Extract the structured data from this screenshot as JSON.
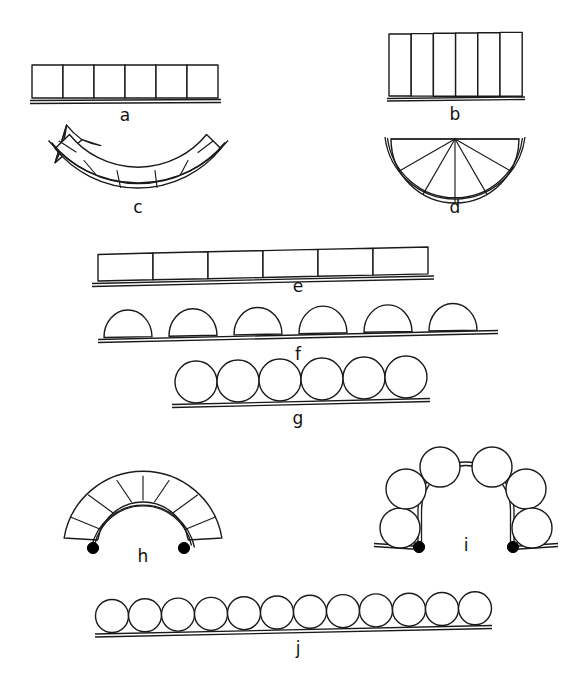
{
  "figure": {
    "title": "",
    "background_color": "#ffffff",
    "ink_color": "#1a1a1a",
    "marker_color": "#000000",
    "width": 575,
    "height": 690,
    "panels": [
      {
        "id": "a",
        "label": "a",
        "label_x": 125,
        "label_y": 121,
        "kind": "flat-strip-rectangular-cells",
        "cell_count": 6,
        "x": 32,
        "y": 65,
        "w": 186,
        "h": 33,
        "baseline": true
      },
      {
        "id": "b",
        "label": "b",
        "label_x": 455,
        "label_y": 120,
        "kind": "flat-strip-tall-cells",
        "cell_count": 6,
        "x": 389,
        "y": 33,
        "w": 133,
        "h": 64,
        "baseline": true
      },
      {
        "id": "c",
        "label": "c",
        "label_x": 138,
        "label_y": 213,
        "kind": "concave-arc-radial-cells",
        "cell_count": 6,
        "center_x": 138,
        "center_y": 76,
        "inner_radius": 72,
        "outer_radius": 107,
        "start_angle": 54,
        "end_angle": 126,
        "baseline": true
      },
      {
        "id": "d",
        "label": "d",
        "label_x": 455,
        "label_y": 213,
        "kind": "half-disc-fan",
        "cell_count": 6,
        "center_x": 455,
        "center_y": 139,
        "radius": 64,
        "start_angle": 0,
        "end_angle": 180,
        "baseline": true
      },
      {
        "id": "e",
        "label": "e",
        "label_x": 298,
        "label_y": 292,
        "kind": "long-flat-strip-cells",
        "cell_count": 6,
        "x": 98,
        "y": 252,
        "w": 330,
        "h": 26,
        "baseline": true
      },
      {
        "id": "f",
        "label": "f",
        "label_x": 298,
        "label_y": 360,
        "kind": "separated-domes-on-baseline",
        "dome_count": 6,
        "baseline_x1": 98,
        "baseline_x2": 498,
        "baseline_y": 338,
        "dome_width": 48,
        "dome_height": 27,
        "dome_pitch": 65,
        "baseline": true
      },
      {
        "id": "g",
        "label": "g",
        "label_x": 298,
        "label_y": 424,
        "kind": "touching-circles-on-baseline",
        "circle_count": 6,
        "circle_radius": 21,
        "baseline_x1": 175,
        "baseline_x2": 420,
        "baseline_y": 404,
        "baseline": true
      },
      {
        "id": "h",
        "label": "h",
        "label_x": 143,
        "label_y": 562,
        "kind": "convex-arch-radial-cells",
        "cell_count": 6,
        "center_x": 143,
        "center_y": 546,
        "inner_radius": 46,
        "outer_radius": 80,
        "start_angle": 10,
        "end_angle": 170,
        "pivot_markers": 2,
        "baseline": true
      },
      {
        "id": "i",
        "label": "i",
        "label_x": 466,
        "label_y": 551,
        "kind": "circles-on-arch",
        "circle_count": 6,
        "circle_radius": 20,
        "center_x": 466,
        "center_y": 546,
        "arch_radius": 48,
        "pivot_markers": 2,
        "baseline": true
      },
      {
        "id": "j",
        "label": "j",
        "label_x": 298,
        "label_y": 654,
        "kind": "touching-circles-on-baseline",
        "circle_count": 12,
        "circle_radius": 16.5,
        "baseline_x1": 95,
        "baseline_x2": 492,
        "baseline_y": 634,
        "baseline": true
      }
    ]
  }
}
